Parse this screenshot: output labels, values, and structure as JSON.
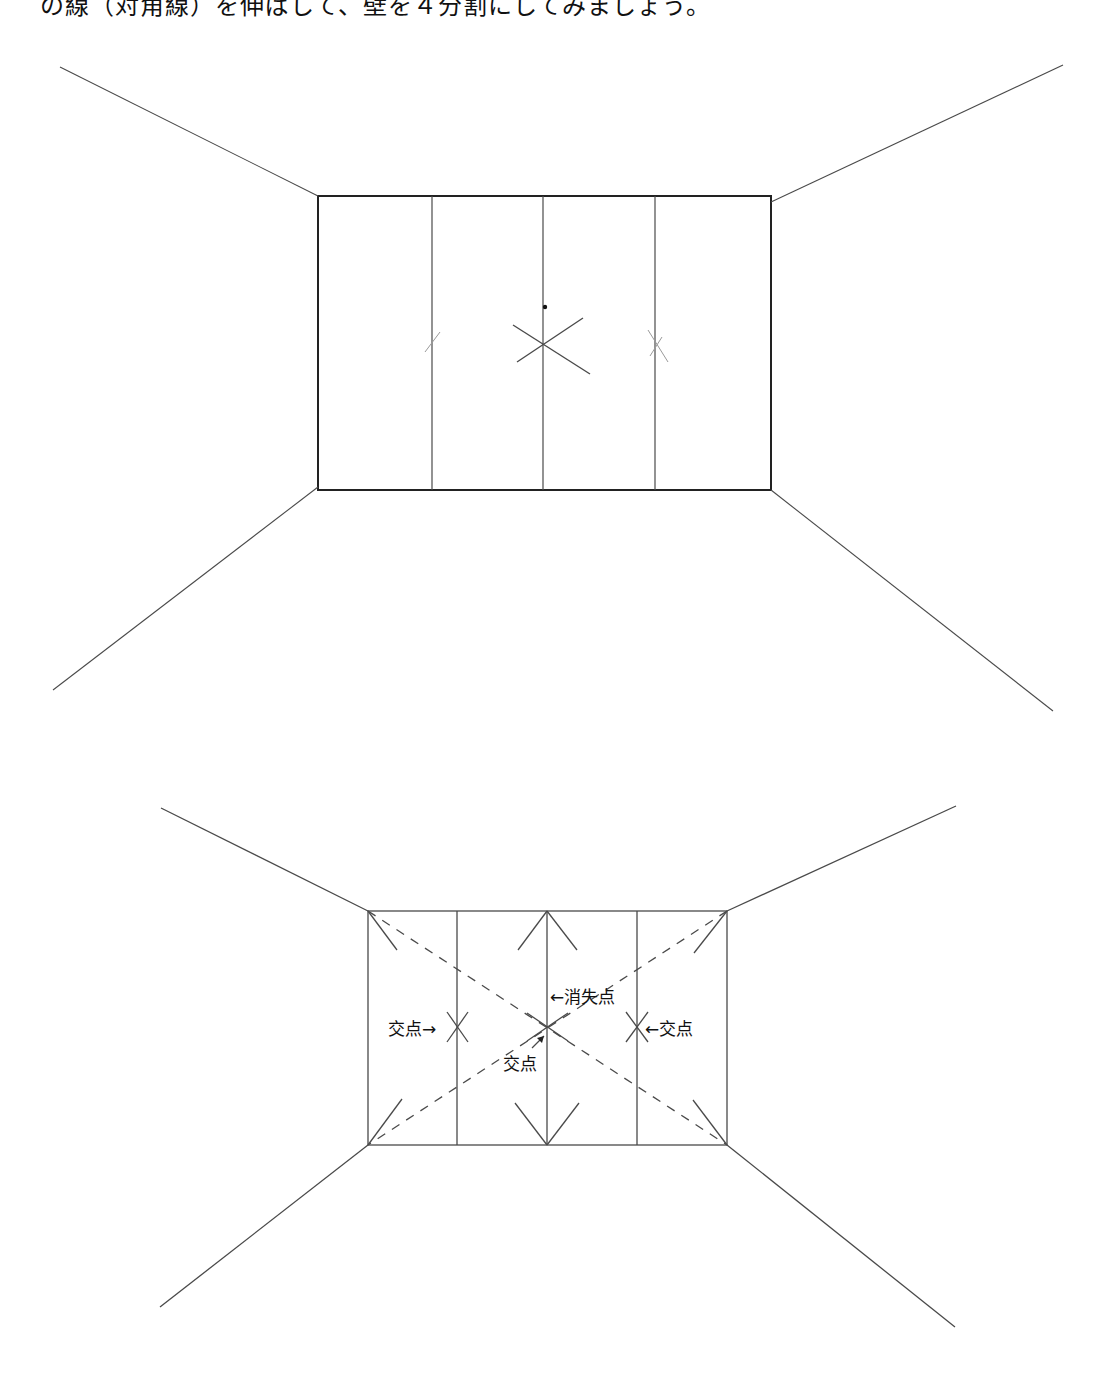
{
  "caption": "の線（対角線）を伸ばして、壁を４分割にしてみましょう。",
  "colors": {
    "ink": "#222222",
    "pencil": "#4a4a4a",
    "pencil_light": "#9a9a9a",
    "background": "#ffffff"
  },
  "sketch": {
    "rect": {
      "x1": 318,
      "y1": 196,
      "x2": 771,
      "y2": 490
    },
    "dividers_x": [
      432,
      543,
      655
    ],
    "perspective_lines": [
      {
        "name": "top-left",
        "x1": 318,
        "y1": 196,
        "x2": 60,
        "y2": 67
      },
      {
        "name": "top-right",
        "x1": 771,
        "y1": 202,
        "x2": 1063,
        "y2": 65
      },
      {
        "name": "bottom-left",
        "x1": 318,
        "y1": 487,
        "x2": 53,
        "y2": 690
      },
      {
        "name": "bottom-right",
        "x1": 771,
        "y1": 490,
        "x2": 1053,
        "y2": 711
      }
    ],
    "vanishing_dot": {
      "x": 545,
      "y": 307
    },
    "center_x_marks": [
      {
        "x1": 513,
        "y1": 325,
        "x2": 590,
        "y2": 374
      },
      {
        "x1": 517,
        "y1": 362,
        "x2": 583,
        "y2": 318
      }
    ],
    "side_x_marks": [
      {
        "x1": 425,
        "y1": 352,
        "x2": 440,
        "y2": 332
      },
      {
        "x1": 648,
        "y1": 330,
        "x2": 668,
        "y2": 362
      },
      {
        "x1": 650,
        "y1": 356,
        "x2": 662,
        "y2": 337
      }
    ]
  },
  "diagram": {
    "rect": {
      "x1": 368,
      "y1": 911,
      "x2": 727,
      "y2": 1145
    },
    "dividers_x": [
      457,
      547,
      637
    ],
    "perspective_lines": [
      {
        "name": "top-left",
        "x1": 368,
        "y1": 911,
        "x2": 161,
        "y2": 808
      },
      {
        "name": "top-right",
        "x1": 727,
        "y1": 911,
        "x2": 956,
        "y2": 806
      },
      {
        "name": "bottom-left",
        "x1": 368,
        "y1": 1145,
        "x2": 160,
        "y2": 1307
      },
      {
        "name": "bottom-right",
        "x1": 727,
        "y1": 1145,
        "x2": 955,
        "y2": 1327
      }
    ],
    "dashed_diagonals": [
      {
        "x1": 368,
        "y1": 911,
        "x2": 727,
        "y2": 1145
      },
      {
        "x1": 727,
        "y1": 911,
        "x2": 368,
        "y2": 1145
      }
    ],
    "corner_strokes": [
      {
        "x1": 368,
        "y1": 911,
        "x2": 397,
        "y2": 950
      },
      {
        "x1": 727,
        "y1": 911,
        "x2": 694,
        "y2": 953
      },
      {
        "x1": 368,
        "y1": 1145,
        "x2": 402,
        "y2": 1099
      },
      {
        "x1": 727,
        "y1": 1145,
        "x2": 693,
        "y2": 1100
      },
      {
        "x1": 547,
        "y1": 911,
        "x2": 518,
        "y2": 950
      },
      {
        "x1": 547,
        "y1": 911,
        "x2": 577,
        "y2": 950
      },
      {
        "x1": 547,
        "y1": 1145,
        "x2": 515,
        "y2": 1103
      },
      {
        "x1": 547,
        "y1": 1145,
        "x2": 579,
        "y2": 1103
      }
    ],
    "cross_marks": [
      {
        "x1": 447,
        "y1": 1012,
        "x2": 468,
        "y2": 1042
      },
      {
        "x1": 447,
        "y1": 1042,
        "x2": 468,
        "y2": 1012
      },
      {
        "x1": 527,
        "y1": 1013,
        "x2": 568,
        "y2": 1041
      },
      {
        "x1": 527,
        "y1": 1041,
        "x2": 568,
        "y2": 1013
      },
      {
        "x1": 626,
        "y1": 1012,
        "x2": 648,
        "y2": 1042
      },
      {
        "x1": 626,
        "y1": 1042,
        "x2": 648,
        "y2": 1012
      }
    ],
    "labels": [
      {
        "id": "vanishing-point",
        "text": "←消失点",
        "x": 550,
        "y": 1003
      },
      {
        "id": "intersection-left",
        "text": "交点→",
        "x": 388,
        "y": 1035
      },
      {
        "id": "intersection-right",
        "text": "←交点",
        "x": 645,
        "y": 1035
      },
      {
        "id": "intersection-center",
        "text": "交点",
        "x": 503,
        "y": 1070
      }
    ],
    "center_arrow": {
      "x1": 532,
      "y1": 1048,
      "x2": 544,
      "y2": 1036
    }
  }
}
